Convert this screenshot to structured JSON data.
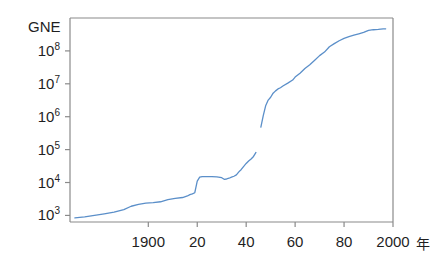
{
  "chart_data": {
    "type": "line",
    "title": "GNE",
    "xlabel": "",
    "ylabel": "GNE",
    "x_unit_label": "年",
    "xlim": [
      1868,
      2000
    ],
    "ylim_log10": [
      2.8,
      9.0
    ],
    "yscale": "log",
    "grid": false,
    "legend": "none",
    "xticks": [
      1900,
      1920,
      1940,
      1960,
      1980,
      2000
    ],
    "xticklabels": [
      "1900",
      "20",
      "40",
      "60",
      "80",
      "2000"
    ],
    "yticks_log10": [
      3,
      4,
      5,
      6,
      7,
      8
    ],
    "yticklabels": [
      "10",
      "10",
      "10",
      "10",
      "10",
      "10"
    ],
    "ytick_exponents": [
      "3",
      "4",
      "5",
      "6",
      "7",
      "8"
    ],
    "line_color": "#5b8fc9",
    "axis_color": "#8a8a8a",
    "background": "#ffffff",
    "series": [
      {
        "name": "GNE segment 1 (prewar)",
        "points": [
          [
            1870,
            840
          ],
          [
            1874,
            900
          ],
          [
            1878,
            1000
          ],
          [
            1882,
            1120
          ],
          [
            1886,
            1260
          ],
          [
            1890,
            1500
          ],
          [
            1893,
            1900
          ],
          [
            1896,
            2150
          ],
          [
            1899,
            2350
          ],
          [
            1902,
            2450
          ],
          [
            1905,
            2600
          ],
          [
            1908,
            3000
          ],
          [
            1911,
            3300
          ],
          [
            1914,
            3500
          ],
          [
            1916,
            3900
          ],
          [
            1917,
            4300
          ],
          [
            1918,
            4500
          ],
          [
            1919,
            4900
          ],
          [
            1920,
            11000
          ],
          [
            1921,
            14500
          ],
          [
            1922,
            15000
          ],
          [
            1924,
            15200
          ],
          [
            1926,
            15000
          ],
          [
            1928,
            14800
          ],
          [
            1930,
            14000
          ],
          [
            1931,
            12500
          ],
          [
            1932,
            12800
          ],
          [
            1933,
            13500
          ],
          [
            1934,
            14500
          ],
          [
            1935,
            15500
          ],
          [
            1936,
            17000
          ],
          [
            1937,
            21000
          ],
          [
            1938,
            25000
          ],
          [
            1939,
            31000
          ],
          [
            1940,
            38000
          ],
          [
            1941,
            45000
          ],
          [
            1942,
            52000
          ],
          [
            1943,
            62000
          ],
          [
            1944,
            82000
          ]
        ]
      },
      {
        "name": "GNE segment 2 (postwar)",
        "points": [
          [
            1946,
            480000
          ],
          [
            1947,
            1100000
          ],
          [
            1948,
            2200000
          ],
          [
            1949,
            3200000
          ],
          [
            1950,
            3900000
          ],
          [
            1951,
            5200000
          ],
          [
            1952,
            6100000
          ],
          [
            1953,
            7000000
          ],
          [
            1954,
            7600000
          ],
          [
            1955,
            8600000
          ],
          [
            1957,
            10500000
          ],
          [
            1959,
            13000000
          ],
          [
            1960,
            16000000
          ],
          [
            1962,
            21000000
          ],
          [
            1964,
            29000000
          ],
          [
            1966,
            38000000
          ],
          [
            1968,
            52000000
          ],
          [
            1970,
            72000000
          ],
          [
            1972,
            92000000
          ],
          [
            1974,
            134000000
          ],
          [
            1976,
            166000000
          ],
          [
            1978,
            204000000
          ],
          [
            1980,
            240000000
          ],
          [
            1982,
            270000000
          ],
          [
            1984,
            300000000
          ],
          [
            1986,
            330000000
          ],
          [
            1988,
            365000000
          ],
          [
            1990,
            420000000
          ],
          [
            1992,
            440000000
          ],
          [
            1994,
            450000000
          ],
          [
            1996,
            465000000
          ],
          [
            1997,
            470000000
          ]
        ]
      }
    ],
    "annotations": [
      {
        "text": "data gap 1944-1946 (wartime break)"
      }
    ]
  }
}
